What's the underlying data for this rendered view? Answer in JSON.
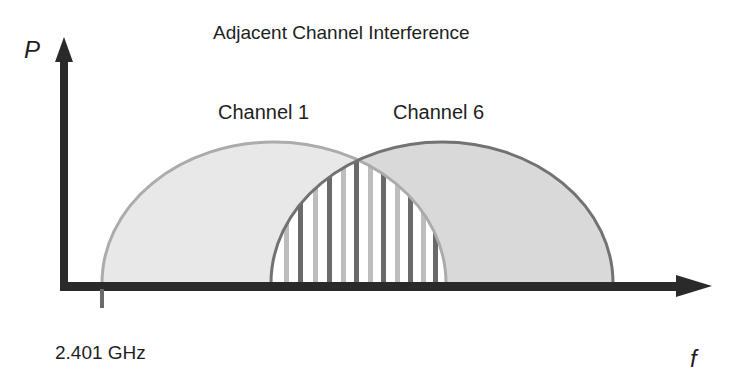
{
  "diagram": {
    "title": "Adjacent Channel Interference",
    "y_axis_label": "P",
    "x_axis_label": "f",
    "start_frequency_label": "2.401 GHz",
    "channels": [
      {
        "label": "Channel 1",
        "fill": "#e6e6e6",
        "stroke": "#a8a8a8"
      },
      {
        "label": "Channel 6",
        "fill": "#d6d6d6",
        "stroke": "#6e6e6e"
      }
    ],
    "overlap_region": "vertical-stripes",
    "axis_color": "#262626"
  }
}
